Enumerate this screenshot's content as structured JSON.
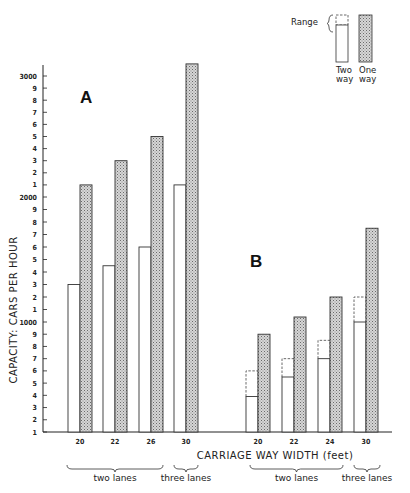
{
  "chart_data": {
    "type": "bar",
    "title": "",
    "xlabel": "CARRIAGE WAY WIDTH (feet)",
    "ylabel": "CAPACITY: CARS PER HOUR",
    "ylim": [
      100,
      3100
    ],
    "grid": false,
    "legend_position": "top-right",
    "legend": {
      "range_label": "Range",
      "entries": [
        {
          "name": "Two way",
          "line1": "Two",
          "line2": "way",
          "style": "open"
        },
        {
          "name": "One way",
          "line1": "One",
          "line2": "way",
          "style": "stippled"
        }
      ]
    },
    "y_ticks": [
      {
        "value": 100,
        "label": "1"
      },
      {
        "value": 200,
        "label": "2"
      },
      {
        "value": 300,
        "label": "3"
      },
      {
        "value": 400,
        "label": "4"
      },
      {
        "value": 500,
        "label": "5"
      },
      {
        "value": 600,
        "label": "6"
      },
      {
        "value": 700,
        "label": "7"
      },
      {
        "value": 800,
        "label": "8"
      },
      {
        "value": 900,
        "label": "9"
      },
      {
        "value": 1000,
        "label": "1000"
      },
      {
        "value": 1100,
        "label": "1"
      },
      {
        "value": 1200,
        "label": "2"
      },
      {
        "value": 1300,
        "label": "3"
      },
      {
        "value": 1400,
        "label": "4"
      },
      {
        "value": 1500,
        "label": "5"
      },
      {
        "value": 1600,
        "label": "6"
      },
      {
        "value": 1700,
        "label": "7"
      },
      {
        "value": 1800,
        "label": "8"
      },
      {
        "value": 1900,
        "label": "9"
      },
      {
        "value": 2000,
        "label": "2000"
      },
      {
        "value": 2100,
        "label": "1"
      },
      {
        "value": 2200,
        "label": "2"
      },
      {
        "value": 2300,
        "label": "3"
      },
      {
        "value": 2400,
        "label": "4"
      },
      {
        "value": 2500,
        "label": "5"
      },
      {
        "value": 2600,
        "label": "6"
      },
      {
        "value": 2700,
        "label": "7"
      },
      {
        "value": 2800,
        "label": "8"
      },
      {
        "value": 2900,
        "label": "9"
      },
      {
        "value": 3000,
        "label": "3000"
      }
    ],
    "panels": [
      {
        "label": "A",
        "categories": [
          "20",
          "22",
          "26",
          "30"
        ],
        "groups": [
          {
            "label": "two lanes",
            "categories": [
              "20",
              "22",
              "26"
            ]
          },
          {
            "label": "three lanes",
            "categories": [
              "30"
            ]
          }
        ],
        "series": [
          {
            "name": "Two way",
            "values": [
              1300,
              1450,
              1600,
              2100
            ],
            "range_upper": [
              null,
              null,
              null,
              null
            ]
          },
          {
            "name": "One way",
            "values": [
              2100,
              2300,
              2500,
              3100
            ]
          }
        ]
      },
      {
        "label": "B",
        "categories": [
          "20",
          "22",
          "24",
          "30"
        ],
        "groups": [
          {
            "label": "two lanes",
            "categories": [
              "20",
              "22",
              "24"
            ]
          },
          {
            "label": "three lanes",
            "categories": [
              "30"
            ]
          }
        ],
        "series": [
          {
            "name": "Two way",
            "values": [
              390,
              550,
              700,
              1000
            ],
            "range_upper": [
              600,
              700,
              850,
              1200
            ]
          },
          {
            "name": "One way",
            "values": [
              900,
              1040,
              1200,
              1750
            ]
          }
        ]
      }
    ]
  },
  "layout_px": {
    "baseline_y": 432,
    "y_map": [
      [
        100,
        432
      ],
      [
        1000,
        322
      ],
      [
        2000,
        197
      ],
      [
        3000,
        76
      ]
    ],
    "axis_x": 43,
    "axis_top_y": 65,
    "axis_right_x": 392,
    "bar_width": 12,
    "panel_bar_x": [
      [
        68,
        103,
        139,
        174
      ],
      [
        246,
        282,
        318,
        354
      ]
    ],
    "panel_label_pos": [
      [
        80,
        103
      ],
      [
        250,
        267
      ]
    ],
    "tick_label_y": 444,
    "group_brackets": [
      [
        {
          "x1": 67,
          "x2": 163
        },
        {
          "x1": 174,
          "x2": 198
        }
      ],
      [
        {
          "x1": 250,
          "x2": 343
        },
        {
          "x1": 354,
          "x2": 380
        }
      ]
    ]
  }
}
